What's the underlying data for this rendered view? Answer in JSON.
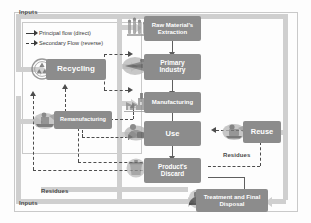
{
  "diagram": {
    "legend": {
      "items": [
        {
          "label": "Principal flow (direct)",
          "style": "solid",
          "icon": "solid-arrow-icon"
        },
        {
          "label": "Secondary Flow (reverse)",
          "style": "dashed",
          "icon": "dashed-arrow-icon"
        }
      ]
    },
    "band_labels": {
      "inputs_top": "Inputs",
      "inputs_bottom": "Inputs",
      "residues_left": "Residues",
      "residues_right": "Residues"
    },
    "nodes": [
      {
        "id": "raw-materials-extraction",
        "label": "Raw Material's\nExtraction",
        "line1": "Raw Material's",
        "line2": "Extraction",
        "icon": "mining-drill-icon"
      },
      {
        "id": "primary-industry",
        "label": "Primary\nIndustry",
        "line1": "Primary",
        "line2": "Industry",
        "icon": "smelter-icon"
      },
      {
        "id": "manufacturing",
        "label": "Manufacturing",
        "line1": "Manufacturing",
        "line2": "",
        "icon": "factory-icon"
      },
      {
        "id": "use",
        "label": "Use",
        "line1": "Use",
        "line2": "",
        "icon": "consumer-icon"
      },
      {
        "id": "products-discard",
        "label": "Product's\nDiscard",
        "line1": "Product's",
        "line2": "Discard",
        "icon": "trash-icon"
      },
      {
        "id": "treatment-and-final-disposal",
        "label": "Treatment and Final\nDisposal",
        "line1": "Treatment and Final",
        "line2": "Disposal",
        "icon": "landfill-icon"
      },
      {
        "id": "recycling",
        "label": "Recycling",
        "line1": "Recycling",
        "line2": "",
        "icon": "recycling-symbol-icon"
      },
      {
        "id": "remanufacturing",
        "label": "Remanufacturing",
        "line1": "Remanufacturing",
        "line2": "",
        "icon": "remanufacturing-icon"
      },
      {
        "id": "reuse",
        "label": "Reuse",
        "line1": "Reuse",
        "line2": "",
        "icon": "reuse-icon"
      }
    ],
    "colors": {
      "box_fill": "#8c8c8c",
      "box_text": "#ffffff",
      "band": "#cfcfcf",
      "solid_flow": "#5f5f5f",
      "dashed_flow": "#4d4d4d",
      "frame": "#c9c9c9",
      "background": "#fdfdfd"
    }
  }
}
